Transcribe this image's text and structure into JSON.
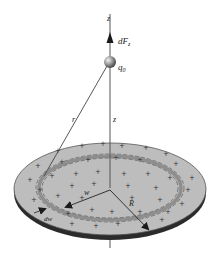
{
  "figure": {
    "caption_fragment": "",
    "labels": {
      "z_top": "z",
      "force": "dF",
      "force_sub": "z",
      "charge": "q",
      "charge_sub": "0",
      "r": "r",
      "z_mid": "z",
      "w": "w",
      "dw": "dw",
      "R": "R"
    },
    "disk": {
      "charge_sign": "+",
      "fill_color": "#bdbdbd",
      "rim_color": "#2b2b2b",
      "ring_color": "#8e8e8e"
    },
    "sphere_color": "#8a8a8a",
    "line_color": "#333333"
  }
}
